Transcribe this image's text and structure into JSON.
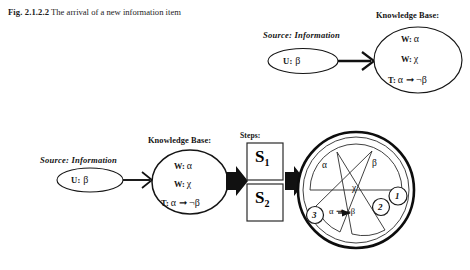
{
  "figure": {
    "caption_number": "Fig. 2.1.2.2",
    "caption_text": "The arrival of a new information item",
    "background_color": "#ffffff",
    "ink_color": "#111111"
  },
  "top_panel": {
    "source_title": "Source: Information",
    "source_ellipse_text": "U:  β",
    "source_prefix": "U:",
    "source_symbol": "β",
    "arrow_name": "arrow-source-to-kb",
    "kb_title": "Knowledge Base:",
    "kb_lines": [
      {
        "prefix": "W:",
        "symbol": "α"
      },
      {
        "prefix": "W:",
        "symbol": "χ"
      },
      {
        "prefix": "T:",
        "symbol": "α ➞ ¬β"
      }
    ]
  },
  "bottom_panel": {
    "source_title": "Source: Information",
    "source_prefix": "U:",
    "source_symbol": "β",
    "kb_title": "Knowledge Base:",
    "kb_lines": [
      {
        "prefix": "W:",
        "symbol": "α"
      },
      {
        "prefix": "W:",
        "symbol": "χ"
      },
      {
        "prefix": "T:",
        "symbol": "α ➞ ¬β"
      }
    ],
    "steps_title": "Steps:",
    "steps": [
      {
        "label": "S",
        "subscript": "1"
      },
      {
        "label": "S",
        "subscript": "2"
      }
    ],
    "result_circle": {
      "sectors": [
        {
          "name": "sector-alpha",
          "label": "α"
        },
        {
          "name": "sector-beta",
          "label": "β"
        },
        {
          "name": "sector-chi",
          "label": "χ"
        },
        {
          "name": "sector-implication",
          "label": "α ➞ ¬β"
        }
      ],
      "markers": [
        {
          "name": "marker-1",
          "label": "1"
        },
        {
          "name": "marker-2",
          "label": "2"
        },
        {
          "name": "marker-3",
          "label": "3"
        }
      ]
    }
  }
}
